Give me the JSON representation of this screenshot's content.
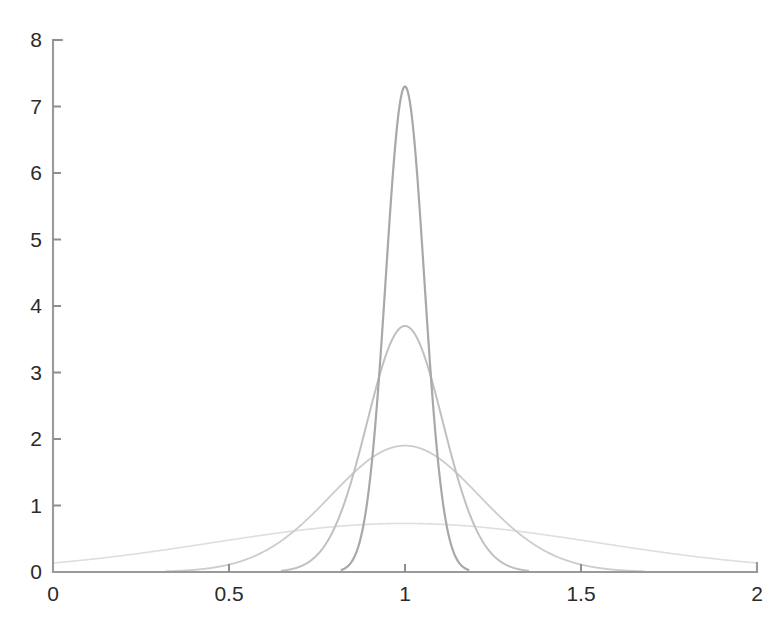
{
  "figure": {
    "title": "",
    "background_color": "#ffffff"
  },
  "axes": {
    "x": {
      "label": "",
      "min": 0,
      "max": 2,
      "ticks": [
        0,
        0.5,
        1,
        1.5,
        2
      ],
      "tick_labels": [
        "0",
        "0.5",
        "1",
        "1.5",
        "2"
      ],
      "axis_color": "#9a9a9a"
    },
    "y": {
      "label": "",
      "min": 0,
      "max": 8,
      "ticks": [
        0,
        1,
        2,
        3,
        4,
        5,
        6,
        7,
        8
      ],
      "tick_labels": [
        "0",
        "1",
        "2",
        "3",
        "4",
        "5",
        "6",
        "7",
        "8"
      ],
      "axis_color": "#9a9a9a"
    },
    "grid": false,
    "box": false,
    "legend": "none"
  },
  "chart_data": {
    "type": "line",
    "title": "",
    "xlabel": "",
    "ylabel": "",
    "xlim": [
      0,
      2
    ],
    "ylim": [
      0,
      8
    ],
    "xticks": [
      0,
      0.5,
      1,
      1.5,
      2
    ],
    "yticks": [
      0,
      1,
      2,
      3,
      4,
      5,
      6,
      7,
      8
    ],
    "grid": false,
    "legend_position": "none",
    "series": [
      {
        "name": "widest",
        "mean": 1.0,
        "sigma": 0.545,
        "peak_y": 0.73,
        "peak_x": 1.0,
        "color": "#dedede",
        "line_width": 1.6,
        "x_range": [
          0.0,
          2.0
        ]
      },
      {
        "name": "wide",
        "mean": 1.0,
        "sigma": 0.21,
        "peak_y": 1.9,
        "peak_x": 1.0,
        "color": "#cccccc",
        "line_width": 1.8,
        "x_range": [
          0.32,
          1.68
        ]
      },
      {
        "name": "narrow",
        "mean": 1.0,
        "sigma": 0.108,
        "peak_y": 3.7,
        "peak_x": 1.0,
        "color": "#c0c0c0",
        "line_width": 2.0,
        "x_range": [
          0.65,
          1.35
        ]
      },
      {
        "name": "narrowest",
        "mean": 1.0,
        "sigma": 0.0546,
        "peak_y": 7.3,
        "peak_x": 1.0,
        "color": "#a8a8a8",
        "line_width": 2.2,
        "x_range": [
          0.82,
          1.18
        ]
      }
    ]
  },
  "geometry": {
    "plot_left_px": 53,
    "plot_right_px": 757,
    "plot_bottom_px": 572,
    "plot_top_px": 40
  }
}
